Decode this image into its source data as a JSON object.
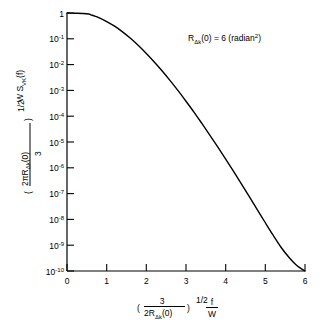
{
  "chart_data": {
    "type": "line",
    "title": "",
    "subtitle": "",
    "xlabel": "( 3 / 2RΔk(0) )^(1/2)  f / W",
    "ylabel": "( 2π RΔk(0) / 3 )^(1/2)  W S_VK(f)",
    "xlabel_parts": {
      "paren_open": "(",
      "numerator": "3",
      "denominator_prefix": "2R",
      "denominator_sub": "Δk",
      "denominator_suffix": "(0)",
      "paren_close": ")",
      "exponent": "1/2",
      "frac_num": "f",
      "frac_den": "W"
    },
    "ylabel_parts": {
      "top_text": "W S",
      "top_sub": "VK",
      "top_suffix": "(f)",
      "paren_open": "(",
      "numerator_prefix": "2πR",
      "numerator_sub": "Δk",
      "numerator_suffix": "(0)",
      "denominator": "3",
      "paren_close": ")",
      "exponent": "1/2"
    },
    "annotation": {
      "text": "RΔk(0) = 6 (radian²)",
      "base": "R",
      "sub": "Δk",
      "rest": "(0) = 6 (radian",
      "sup": "2",
      "tail": ")"
    },
    "xticks": [
      0,
      1,
      2,
      3,
      4,
      5,
      6
    ],
    "xtick_labels": [
      "0",
      "1",
      "2",
      "3",
      "4",
      "5",
      "6"
    ],
    "xlim": [
      0,
      6
    ],
    "yticks": [
      0,
      -1,
      -2,
      -3,
      -4,
      -5,
      -6,
      -7,
      -8,
      -9,
      -10
    ],
    "ytick_labels": [
      "1",
      "10⁻¹",
      "10⁻²",
      "10⁻³",
      "10⁻⁴",
      "10⁻⁵",
      "10⁻⁶",
      "10⁻⁷",
      "10⁻⁸",
      "10⁻⁹",
      "10⁻¹⁰"
    ],
    "ytick_mantissa": [
      "1",
      "10",
      "10",
      "10",
      "10",
      "10",
      "10",
      "10",
      "10",
      "10",
      "10"
    ],
    "ytick_exponent": [
      "",
      "-1",
      "-2",
      "-3",
      "-4",
      "-5",
      "-6",
      "-7",
      "-8",
      "-9",
      "-10"
    ],
    "ylim_log10": [
      0,
      -10
    ],
    "yscale": "log",
    "grid": false,
    "legend": null,
    "series": [
      {
        "name": "Von Karman normalized spectrum",
        "color": "#000000",
        "x": [
          0.0,
          0.2,
          0.4,
          0.55,
          0.6,
          0.7,
          0.8,
          1.0,
          1.2,
          1.4,
          1.6,
          1.8,
          2.0,
          2.2,
          2.4,
          2.6,
          2.8,
          3.0,
          3.2,
          3.4,
          3.6,
          3.8,
          4.0,
          4.2,
          4.4,
          4.6,
          4.8,
          5.0,
          5.2,
          5.4,
          5.6,
          5.8,
          6.0
        ],
        "y_log10": [
          0.0,
          -0.01,
          -0.02,
          -0.04,
          -0.07,
          -0.12,
          -0.18,
          -0.33,
          -0.51,
          -0.73,
          -0.98,
          -1.26,
          -1.57,
          -1.9,
          -2.25,
          -2.62,
          -3.01,
          -3.42,
          -3.84,
          -4.28,
          -4.73,
          -5.19,
          -5.66,
          -6.14,
          -6.63,
          -7.13,
          -7.63,
          -8.13,
          -8.62,
          -9.09,
          -9.48,
          -9.8,
          -10.0
        ]
      }
    ]
  }
}
